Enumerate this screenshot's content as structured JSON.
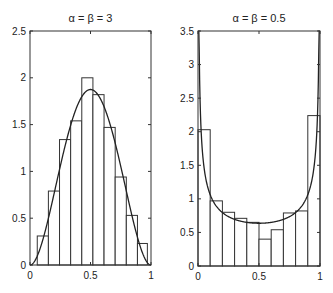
{
  "chart_data": [
    {
      "type": "bar",
      "title": "α = β = 3",
      "xlabel": "",
      "ylabel": "",
      "xlim": [
        0,
        1
      ],
      "ylim": [
        0,
        2.5
      ],
      "x_ticks": [
        "0",
        "0.5",
        "1"
      ],
      "y_ticks": [
        "0",
        "0.5",
        "1",
        "1.5",
        "2",
        "2.5"
      ],
      "grid": false,
      "histogram": {
        "bin_edges": [
          0.06,
          0.152,
          0.244,
          0.336,
          0.428,
          0.52,
          0.612,
          0.704,
          0.796,
          0.888,
          0.97
        ],
        "values": [
          0.31,
          0.79,
          1.34,
          1.54,
          2.0,
          1.82,
          1.47,
          0.94,
          0.53,
          0.23
        ]
      },
      "series": [
        {
          "name": "Beta(3,3) density",
          "type": "line",
          "formula": "30*x^2*(1-x)^2"
        }
      ]
    },
    {
      "type": "bar",
      "title": "α = β = 0.5",
      "xlabel": "",
      "ylabel": "",
      "xlim": [
        0,
        1
      ],
      "ylim": [
        0,
        3.5
      ],
      "x_ticks": [
        "0",
        "0.5",
        "1"
      ],
      "y_ticks": [
        "0",
        "0.5",
        "1",
        "1.5",
        "2",
        "2.5",
        "3",
        "3.5"
      ],
      "grid": false,
      "histogram": {
        "bin_edges": [
          0,
          0.1,
          0.2,
          0.3,
          0.4,
          0.5,
          0.6,
          0.7,
          0.8,
          0.9,
          1.0
        ],
        "values": [
          2.03,
          0.97,
          0.8,
          0.71,
          0.65,
          0.4,
          0.54,
          0.79,
          0.82,
          2.24
        ]
      },
      "series": [
        {
          "name": "Beta(0.5,0.5) density",
          "type": "line",
          "formula": "1/(pi*sqrt(x*(1-x)))"
        }
      ]
    }
  ]
}
